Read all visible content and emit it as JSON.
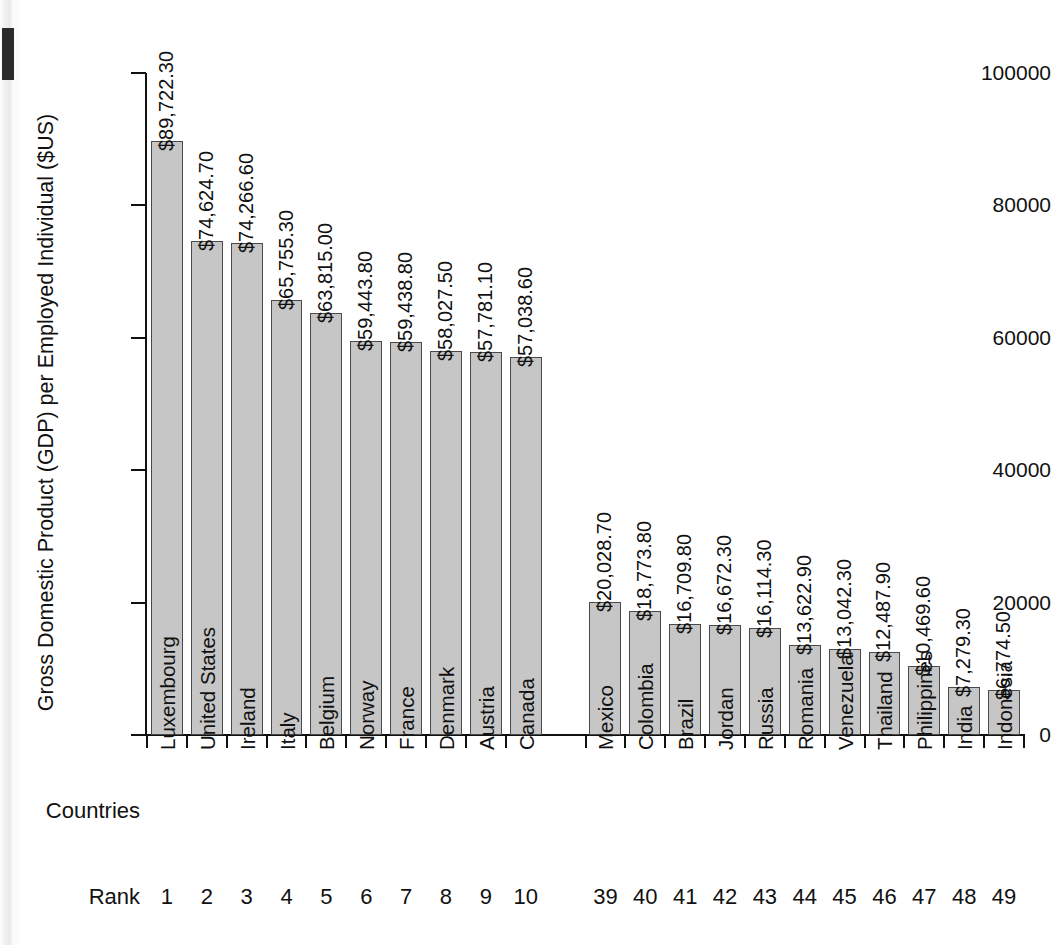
{
  "figure": {
    "row_label_countries": "Countries",
    "row_label_rank": "Rank"
  },
  "chart_data": {
    "type": "bar",
    "title": "",
    "xlabel": "Countries",
    "ylabel": "Gross Domestic Product (GDP) per Employed Individual ($US)",
    "ylim": [
      0,
      100000
    ],
    "ytick_values": [
      0,
      20000,
      40000,
      60000,
      80000,
      100000
    ],
    "ytick_labels": [
      "0",
      "20000",
      "40000",
      "60000",
      "80000",
      "100000"
    ],
    "grid": false,
    "legend": null,
    "group_gap_after_index": 9,
    "categories": [
      "Luxembourg",
      "United States",
      "Ireland",
      "Italy",
      "Belgium",
      "Norway",
      "France",
      "Denmark",
      "Austria",
      "Canada",
      "Mexico",
      "Colombia",
      "Brazil",
      "Jordan",
      "Russia",
      "Romania",
      "Venezuela",
      "Thailand",
      "Philippines",
      "India",
      "Indonesia"
    ],
    "values": [
      89722.3,
      74624.7,
      74266.6,
      65755.3,
      63815.0,
      59443.8,
      59438.8,
      58027.5,
      57781.1,
      57038.6,
      20028.7,
      18773.8,
      16709.8,
      16672.3,
      16114.3,
      13622.9,
      13042.3,
      12487.9,
      10469.6,
      7279.3,
      6774.5
    ],
    "value_labels": [
      "$89,722.30",
      "$74,624.70",
      "$74,266.60",
      "$65,755.30",
      "$63,815.00",
      "$59,443.80",
      "$59,438.80",
      "$58,027.50",
      "$57,781.10",
      "$57,038.60",
      "$20,028.70",
      "$18,773.80",
      "$16,709.80",
      "$16,672.30",
      "$16,114.30",
      "$13,622.90",
      "$13,042.30",
      "$12,487.90",
      "$10,469.60",
      "$7,279.30",
      "$6,774.50"
    ],
    "ranks": [
      "1",
      "2",
      "3",
      "4",
      "5",
      "6",
      "7",
      "8",
      "9",
      "10",
      "39",
      "40",
      "41",
      "42",
      "43",
      "44",
      "45",
      "46",
      "47",
      "48",
      "49"
    ],
    "colors": {
      "bar_fill": "#c6c6c6",
      "bar_stroke": "#4a4a4a",
      "axis": "#111111",
      "text": "#111111",
      "background": "#ffffff"
    }
  }
}
